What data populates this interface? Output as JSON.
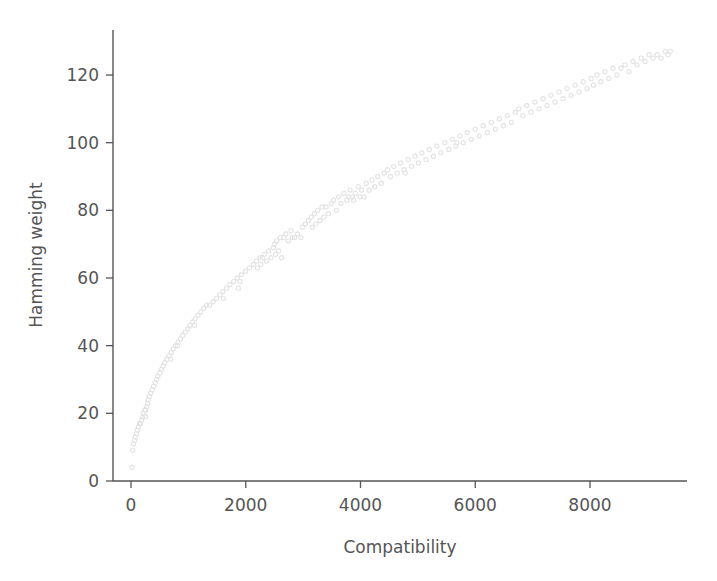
{
  "chart_data": {
    "type": "scatter",
    "title": "",
    "xlabel": "Compatibility",
    "ylabel": "Hamming weight",
    "xlim": [
      -430,
      9750
    ],
    "ylim": [
      -4.5,
      134
    ],
    "xticks": [
      0,
      2000,
      4000,
      6000,
      8000
    ],
    "xticklabels": [
      "0",
      "2000",
      "4000",
      "6000",
      "8000"
    ],
    "yticks": [
      0,
      20,
      40,
      60,
      80,
      100,
      120
    ],
    "yticklabels": [
      "0",
      "20",
      "40",
      "60",
      "80",
      "100",
      "120"
    ],
    "grid": false,
    "legend": null,
    "marker": {
      "shape": "circle",
      "size": 4.2,
      "color": "#e3e3e3",
      "filled": false
    },
    "series": [
      {
        "name": "samples",
        "points": [
          [
            20,
            4
          ],
          [
            30,
            9
          ],
          [
            45,
            11
          ],
          [
            60,
            12
          ],
          [
            75,
            13
          ],
          [
            95,
            14
          ],
          [
            110,
            15
          ],
          [
            130,
            16
          ],
          [
            150,
            17
          ],
          [
            165,
            17
          ],
          [
            185,
            18
          ],
          [
            200,
            19
          ],
          [
            215,
            20
          ],
          [
            240,
            21
          ],
          [
            255,
            21
          ],
          [
            275,
            22
          ],
          [
            250,
            19
          ],
          [
            290,
            23
          ],
          [
            300,
            24
          ],
          [
            320,
            25
          ],
          [
            345,
            26
          ],
          [
            370,
            27
          ],
          [
            395,
            28
          ],
          [
            420,
            29
          ],
          [
            445,
            30
          ],
          [
            470,
            31
          ],
          [
            500,
            32
          ],
          [
            530,
            33
          ],
          [
            560,
            34
          ],
          [
            590,
            35
          ],
          [
            625,
            36
          ],
          [
            660,
            37
          ],
          [
            690,
            36
          ],
          [
            700,
            38
          ],
          [
            735,
            39
          ],
          [
            775,
            40
          ],
          [
            810,
            40
          ],
          [
            820,
            41
          ],
          [
            860,
            42
          ],
          [
            900,
            43
          ],
          [
            945,
            44
          ],
          [
            990,
            45
          ],
          [
            1030,
            46
          ],
          [
            1075,
            47
          ],
          [
            1120,
            48
          ],
          [
            1110,
            46
          ],
          [
            1170,
            49
          ],
          [
            1215,
            50
          ],
          [
            1265,
            51
          ],
          [
            1320,
            52
          ],
          [
            1370,
            52
          ],
          [
            1430,
            53
          ],
          [
            1490,
            54
          ],
          [
            1550,
            55
          ],
          [
            1600,
            56
          ],
          [
            1610,
            54
          ],
          [
            1665,
            57
          ],
          [
            1725,
            58
          ],
          [
            1790,
            59
          ],
          [
            1855,
            60
          ],
          [
            1870,
            57
          ],
          [
            1900,
            59
          ],
          [
            1925,
            61
          ],
          [
            1995,
            62
          ],
          [
            2065,
            63
          ],
          [
            2135,
            64
          ],
          [
            2185,
            65
          ],
          [
            2205,
            63
          ],
          [
            2250,
            66
          ],
          [
            2265,
            64
          ],
          [
            2290,
            66
          ],
          [
            2325,
            67
          ],
          [
            2360,
            65
          ],
          [
            2400,
            68
          ],
          [
            2440,
            66
          ],
          [
            2480,
            69
          ],
          [
            2500,
            70
          ],
          [
            2520,
            67
          ],
          [
            2540,
            71
          ],
          [
            2570,
            68
          ],
          [
            2600,
            72
          ],
          [
            2625,
            66
          ],
          [
            2660,
            72
          ],
          [
            2700,
            73
          ],
          [
            2745,
            71
          ],
          [
            2790,
            74
          ],
          [
            2810,
            72
          ],
          [
            2850,
            72
          ],
          [
            2900,
            73
          ],
          [
            2960,
            72
          ],
          [
            2990,
            75
          ],
          [
            3040,
            76
          ],
          [
            3090,
            77
          ],
          [
            3140,
            78
          ],
          [
            3160,
            75
          ],
          [
            3195,
            79
          ],
          [
            3220,
            76
          ],
          [
            3255,
            80
          ],
          [
            3290,
            77
          ],
          [
            3330,
            81
          ],
          [
            3360,
            78
          ],
          [
            3400,
            81
          ],
          [
            3440,
            79
          ],
          [
            3490,
            82
          ],
          [
            3530,
            83
          ],
          [
            3580,
            80
          ],
          [
            3620,
            84
          ],
          [
            3660,
            82
          ],
          [
            3710,
            85
          ],
          [
            3760,
            83
          ],
          [
            3790,
            84
          ],
          [
            3820,
            86
          ],
          [
            3860,
            84
          ],
          [
            3880,
            83
          ],
          [
            3910,
            85
          ],
          [
            3960,
            87
          ],
          [
            3990,
            84
          ],
          [
            4020,
            86
          ],
          [
            4060,
            84
          ],
          [
            4100,
            88
          ],
          [
            4150,
            86
          ],
          [
            4200,
            89
          ],
          [
            4250,
            87
          ],
          [
            4300,
            90
          ],
          [
            4360,
            88
          ],
          [
            4410,
            91
          ],
          [
            4470,
            92
          ],
          [
            4520,
            90
          ],
          [
            4580,
            93
          ],
          [
            4640,
            91
          ],
          [
            4700,
            94
          ],
          [
            4760,
            92
          ],
          [
            4780,
            91
          ],
          [
            4830,
            95
          ],
          [
            4890,
            93
          ],
          [
            4950,
            96
          ],
          [
            5010,
            94
          ],
          [
            5070,
            97
          ],
          [
            5140,
            95
          ],
          [
            5200,
            98
          ],
          [
            5270,
            96
          ],
          [
            5330,
            99
          ],
          [
            5400,
            97
          ],
          [
            5470,
            100
          ],
          [
            5540,
            98
          ],
          [
            5600,
            101
          ],
          [
            5660,
            99
          ],
          [
            5680,
            100
          ],
          [
            5730,
            102
          ],
          [
            5790,
            100
          ],
          [
            5860,
            103
          ],
          [
            5930,
            101
          ],
          [
            6000,
            104
          ],
          [
            6070,
            102
          ],
          [
            6140,
            105
          ],
          [
            6210,
            103
          ],
          [
            6280,
            106
          ],
          [
            6350,
            104
          ],
          [
            6420,
            107
          ],
          [
            6490,
            105
          ],
          [
            6560,
            108
          ],
          [
            6630,
            106
          ],
          [
            6700,
            109
          ],
          [
            6760,
            110
          ],
          [
            6830,
            108
          ],
          [
            6900,
            111
          ],
          [
            6970,
            109
          ],
          [
            7040,
            112
          ],
          [
            7110,
            110
          ],
          [
            7180,
            113
          ],
          [
            7250,
            111
          ],
          [
            7320,
            114
          ],
          [
            7390,
            112
          ],
          [
            7460,
            115
          ],
          [
            7530,
            113
          ],
          [
            7600,
            116
          ],
          [
            7670,
            114
          ],
          [
            7740,
            117
          ],
          [
            7810,
            115
          ],
          [
            7880,
            118
          ],
          [
            7950,
            116
          ],
          [
            8020,
            119
          ],
          [
            8060,
            117
          ],
          [
            8120,
            120
          ],
          [
            8190,
            118
          ],
          [
            8260,
            121
          ],
          [
            8330,
            119
          ],
          [
            8400,
            122
          ],
          [
            8470,
            120
          ],
          [
            8540,
            122
          ],
          [
            8610,
            123
          ],
          [
            8680,
            121
          ],
          [
            8750,
            124
          ],
          [
            8820,
            123
          ],
          [
            8890,
            125
          ],
          [
            8960,
            124
          ],
          [
            9030,
            126
          ],
          [
            9100,
            125
          ],
          [
            9170,
            126
          ],
          [
            9240,
            125
          ],
          [
            9310,
            127
          ],
          [
            9360,
            126
          ],
          [
            9400,
            127
          ]
        ]
      }
    ]
  },
  "colors": {
    "marker": "#e3e3e3",
    "axis": "#555555",
    "background": "#ffffff"
  }
}
